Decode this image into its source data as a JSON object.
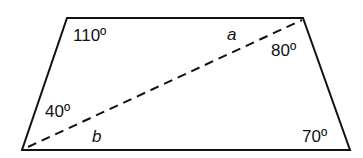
{
  "diagram": {
    "shape": "trapezoid",
    "vertices": {
      "top_left": [
        67,
        18
      ],
      "top_right": [
        303,
        18
      ],
      "bottom_right": [
        350,
        150
      ],
      "bottom_left": [
        22,
        150
      ]
    },
    "diagonal": {
      "from": [
        28,
        147
      ],
      "to": [
        302,
        20
      ],
      "style": "dashed"
    },
    "labels": {
      "angle_top_left": "110º",
      "angle_top_right": "80º",
      "angle_bottom_left": "40º",
      "angle_bottom_right": "70º",
      "var_a": "a",
      "var_b": "b"
    },
    "colors": {
      "stroke": "#111111",
      "background": "#ffffff"
    }
  }
}
